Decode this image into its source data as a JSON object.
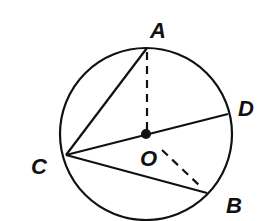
{
  "diagram": {
    "type": "circle-geometry",
    "circle": {
      "center": "O",
      "cx": 146,
      "cy": 134,
      "r": 86
    },
    "points": [
      {
        "name": "A",
        "x": 147,
        "y": 48,
        "label": "A",
        "lx": 150,
        "ly": 38
      },
      {
        "name": "D",
        "x": 228,
        "y": 114,
        "label": "D",
        "lx": 238,
        "ly": 116
      },
      {
        "name": "C",
        "x": 66,
        "y": 155,
        "label": "C",
        "lx": 31,
        "ly": 174
      },
      {
        "name": "B",
        "x": 207,
        "y": 193,
        "label": "B",
        "lx": 226,
        "ly": 213
      },
      {
        "name": "O",
        "x": 146,
        "y": 134,
        "label": "O",
        "lx": 140,
        "ly": 166
      }
    ],
    "solid_segments": [
      {
        "from": "C",
        "to": "A"
      },
      {
        "from": "C",
        "to": "D"
      },
      {
        "from": "C",
        "to": "B"
      }
    ],
    "dashed_segments": [
      {
        "from": "O",
        "to": "A"
      },
      {
        "from": "O",
        "to": "B"
      }
    ],
    "colors": {
      "stroke": "#111111",
      "background": "#ffffff"
    }
  }
}
